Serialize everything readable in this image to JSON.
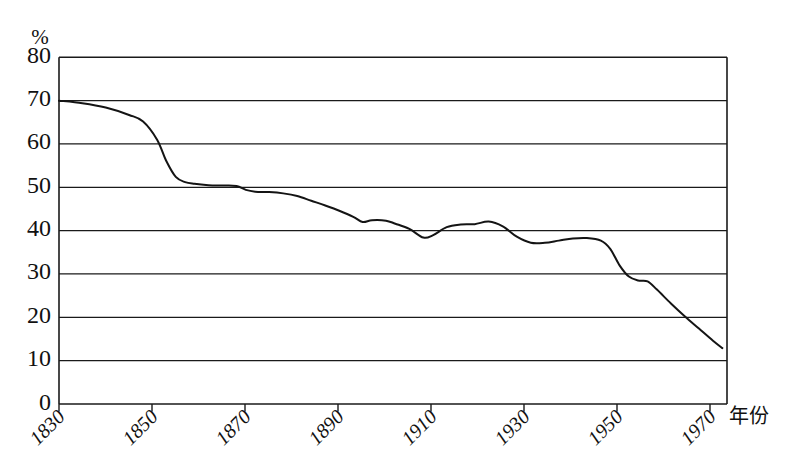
{
  "chart_data": {
    "type": "line",
    "title": "",
    "subtitle": "",
    "xlabel": "年份",
    "ylabel": "%",
    "unit_label": "%",
    "xlim": [
      1830,
      1973
    ],
    "ylim": [
      0,
      80
    ],
    "grid": true,
    "legend": "none",
    "y_ticks": [
      80,
      70,
      60,
      50,
      40,
      30,
      20,
      10,
      0
    ],
    "y_tick_labels": [
      "80",
      "70",
      "60",
      "50",
      "40",
      "30",
      "20",
      "10",
      "0"
    ],
    "x_ticks": [
      1830,
      1850,
      1870,
      1890,
      1910,
      1930,
      1950,
      1970
    ],
    "x_tick_labels": [
      "1830",
      "1850",
      "1870",
      "1890",
      "1910",
      "1930",
      "1950",
      "1970"
    ],
    "series": [
      {
        "name": "percentage",
        "x": [
          1830,
          1835,
          1840,
          1845,
          1848,
          1851,
          1853,
          1855,
          1857,
          1859,
          1862,
          1865,
          1868,
          1870,
          1872,
          1875,
          1878,
          1881,
          1884,
          1887,
          1890,
          1893,
          1895,
          1897,
          1900,
          1902,
          1905,
          1908,
          1910,
          1913,
          1916,
          1919,
          1922,
          1925,
          1928,
          1931,
          1934,
          1937,
          1940,
          1943,
          1946,
          1948,
          1950,
          1952,
          1954,
          1956,
          1958,
          1961,
          1964,
          1967,
          1970,
          1972
        ],
        "y": [
          70.0,
          69.4,
          68.4,
          66.7,
          65.2,
          61.0,
          56.0,
          52.4,
          51.2,
          50.8,
          50.5,
          50.4,
          50.3,
          49.4,
          49.0,
          48.9,
          48.6,
          48.0,
          46.9,
          45.8,
          44.6,
          43.2,
          42.0,
          42.4,
          42.3,
          41.6,
          40.4,
          38.4,
          38.9,
          40.8,
          41.4,
          41.5,
          42.1,
          41.0,
          38.6,
          37.2,
          37.2,
          37.7,
          38.2,
          38.3,
          37.7,
          35.8,
          32.0,
          29.4,
          28.5,
          28.3,
          26.4,
          23.2,
          20.2,
          17.4,
          14.6,
          12.9
        ],
        "color": "#141414"
      }
    ],
    "annotations": []
  },
  "axis": {
    "y_unit": "%",
    "x_axis_name": "年份"
  }
}
